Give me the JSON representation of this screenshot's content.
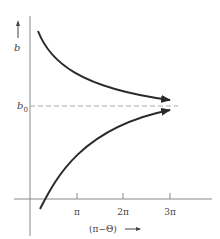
{
  "diagram": {
    "y_axis": {
      "label": "b",
      "arrow": "up-arrow"
    },
    "x_axis": {
      "label": "(π−Θ)",
      "arrow": "right-arrow",
      "ticks": [
        "π",
        "2π",
        "3π"
      ]
    },
    "reference_line": {
      "label": "b",
      "subscript": "0",
      "style": "dashed"
    },
    "curves": [
      {
        "name": "upper-curve",
        "description": "decreasing, approaches b0 from above"
      },
      {
        "name": "lower-curve",
        "description": "increasing, approaches b0 from below"
      }
    ],
    "colors": {
      "axis": "#888888",
      "curve": "#2a2a2a",
      "dashed": "#aaaaaa",
      "text": "#444444"
    }
  }
}
